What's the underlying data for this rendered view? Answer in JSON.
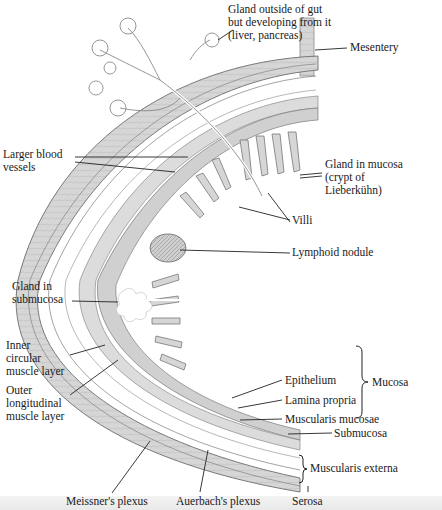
{
  "diagram": {
    "colors": {
      "tissue": "#d9d9d9",
      "tissue_dark": "#bdbdbd",
      "outline": "#7a7a7a",
      "lumen": "#ffffff",
      "leader": "#222222",
      "text": "#1a1a1a"
    },
    "labels": {
      "gland_outside": "Gland outside of gut\nbut developing from it\n(liver, pancreas)",
      "mesentery": "Mesentery",
      "larger_blood_vessels": "Larger blood\nvessels",
      "gland_in_mucosa": "Gland in mucosa\n(crypt of\nLieberkühn)",
      "villi": "Villi",
      "lymphoid_nodule": "Lymphoid nodule",
      "gland_in_submucosa": "Gland in\nsubmucosa",
      "inner_circular": "Inner\ncircular\nmuscle layer",
      "outer_longitudinal": "Outer\nlongitudinal\nmuscle layer",
      "epithelium": "Epithelium",
      "lamina_propria": "Lamina propria",
      "muscularis_mucosae": "Muscularis mucosae",
      "mucosa": "Mucosa",
      "submucosa": "Submucosa",
      "muscularis_externa": "Muscularis externa",
      "meissners_plexus": "Meissner's plexus",
      "auerbachs_plexus": "Auerbach's plexus",
      "serosa": "Serosa"
    }
  }
}
